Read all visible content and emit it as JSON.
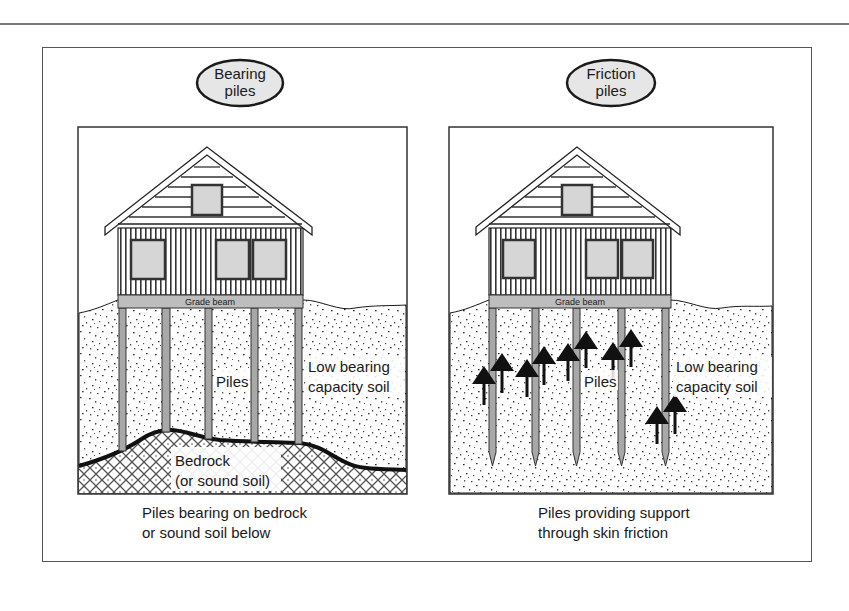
{
  "figure": {
    "panels": [
      {
        "id": "bearing",
        "badge_line1": "Bearing",
        "badge_line2": "piles",
        "grade_beam": "Grade beam",
        "piles_label": "Piles",
        "soil_line1": "Low bearing",
        "soil_line2": "capacity soil",
        "bedrock_line1": "Bedrock",
        "bedrock_line2": "(or sound soil)",
        "caption_line1": "Piles bearing on bedrock",
        "caption_line2": "or sound soil below"
      },
      {
        "id": "friction",
        "badge_line1": "Friction",
        "badge_line2": "piles",
        "grade_beam": "Grade beam",
        "piles_label": "Piles",
        "soil_line1": "Low bearing",
        "soil_line2": "capacity soil",
        "caption_line1": "Piles providing support",
        "caption_line2": "through skin friction"
      }
    ],
    "colors": {
      "line": "#1a1a1a",
      "pile_fill": "#a8a8a8",
      "window_fill": "#d6d6d6",
      "beam_fill": "#bdbdbd",
      "badge_fill": "#e6e6e6"
    },
    "icons": {
      "friction_arrow": "up-arrow"
    }
  }
}
